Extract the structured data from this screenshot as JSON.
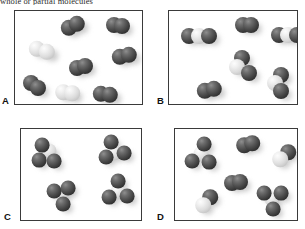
{
  "figure": {
    "caption_partial": "whole or partial molecules",
    "background_color": "#ffffff",
    "border_color": "#3a3a3a",
    "dark_atom_color": "#3a3a3a",
    "light_atom_color": "#dcdcdc"
  },
  "panels": [
    {
      "label": "A",
      "box": {
        "x": 14,
        "y": 10,
        "w": 129,
        "h": 95
      },
      "label_pos": {
        "x": 2,
        "y": 96
      },
      "description": "Six dark homonuclear diatomic molecules and two light homonuclear diatomic molecules",
      "molecules": [
        {
          "name": "dark-diatomic",
          "atoms": [
            {
              "type": "dark",
              "cx": 54,
              "cy": 17,
              "r": 8.2
            },
            {
              "type": "dark",
              "cx": 62,
              "cy": 13,
              "r": 8.2
            }
          ]
        },
        {
          "name": "dark-diatomic",
          "atoms": [
            {
              "type": "dark",
              "cx": 99,
              "cy": 14,
              "r": 8.0
            },
            {
              "type": "dark",
              "cx": 107,
              "cy": 15,
              "r": 8.0
            }
          ]
        },
        {
          "name": "light-diatomic",
          "atoms": [
            {
              "type": "light",
              "cx": 22,
              "cy": 38,
              "r": 8.2
            },
            {
              "type": "light",
              "cx": 32,
              "cy": 41,
              "r": 8.2
            }
          ]
        },
        {
          "name": "dark-diatomic",
          "atoms": [
            {
              "type": "dark",
              "cx": 105,
              "cy": 46,
              "r": 8.2
            },
            {
              "type": "dark",
              "cx": 114,
              "cy": 44,
              "r": 8.2
            }
          ]
        },
        {
          "name": "dark-diatomic",
          "atoms": [
            {
              "type": "dark",
              "cx": 62,
              "cy": 57,
              "r": 8.0
            },
            {
              "type": "dark",
              "cx": 70,
              "cy": 55,
              "r": 8.0
            }
          ]
        },
        {
          "name": "dark-diatomic",
          "atoms": [
            {
              "type": "dark",
              "cx": 16,
              "cy": 72,
              "r": 8.0
            },
            {
              "type": "dark",
              "cx": 23,
              "cy": 77,
              "r": 8.0
            }
          ]
        },
        {
          "name": "light-diatomic",
          "atoms": [
            {
              "type": "light",
              "cx": 48,
              "cy": 81,
              "r": 7.8
            },
            {
              "type": "light",
              "cx": 57,
              "cy": 82,
              "r": 7.8
            }
          ]
        },
        {
          "name": "dark-diatomic",
          "atoms": [
            {
              "type": "dark",
              "cx": 86,
              "cy": 83,
              "r": 8.2
            },
            {
              "type": "dark",
              "cx": 95,
              "cy": 84,
              "r": 8.2
            }
          ]
        }
      ]
    },
    {
      "label": "B",
      "box": {
        "x": 168,
        "y": 10,
        "w": 130,
        "h": 95
      },
      "label_pos": {
        "x": 157,
        "y": 96
      },
      "description": "Mixture of dark-light-dark triatomic molecules and dark homonuclear diatomic molecules",
      "molecules": [
        {
          "name": "dark-light-dark-triatomic",
          "atoms": [
            {
              "type": "dark",
              "cx": 20,
              "cy": 25,
              "r": 8.0
            },
            {
              "type": "light",
              "cx": 30,
              "cy": 25,
              "r": 8.0
            },
            {
              "type": "dark",
              "cx": 40,
              "cy": 25,
              "r": 8.0
            }
          ]
        },
        {
          "name": "dark-diatomic",
          "atoms": [
            {
              "type": "dark",
              "cx": 74,
              "cy": 14,
              "r": 8.0
            },
            {
              "type": "dark",
              "cx": 82,
              "cy": 14,
              "r": 8.0
            }
          ]
        },
        {
          "name": "dark-light-dark-triatomic",
          "atoms": [
            {
              "type": "dark",
              "cx": 110,
              "cy": 24,
              "r": 8.0
            },
            {
              "type": "light",
              "cx": 119,
              "cy": 24,
              "r": 8.0
            },
            {
              "type": "dark",
              "cx": 128,
              "cy": 24,
              "r": 8.0
            }
          ]
        },
        {
          "name": "dark-light-dark-triatomic",
          "atoms": [
            {
              "type": "dark",
              "cx": 73,
              "cy": 47,
              "r": 8.0
            },
            {
              "type": "light",
              "cx": 68,
              "cy": 56,
              "r": 8.0
            },
            {
              "type": "dark",
              "cx": 80,
              "cy": 62,
              "r": 8.0
            }
          ]
        },
        {
          "name": "dark-light-dark-triatomic",
          "atoms": [
            {
              "type": "dark",
              "cx": 112,
              "cy": 64,
              "r": 8.0
            },
            {
              "type": "light",
              "cx": 106,
              "cy": 72,
              "r": 8.0
            },
            {
              "type": "dark",
              "cx": 112,
              "cy": 80,
              "r": 8.0
            }
          ]
        },
        {
          "name": "dark-diatomic",
          "atoms": [
            {
              "type": "dark",
              "cx": 36,
              "cy": 80,
              "r": 8.2
            },
            {
              "type": "dark",
              "cx": 45,
              "cy": 78,
              "r": 8.2
            }
          ]
        }
      ]
    },
    {
      "label": "C",
      "box": {
        "x": 20,
        "y": 128,
        "w": 122,
        "h": 93
      },
      "label_pos": {
        "x": 4,
        "y": 212
      },
      "description": "Four identical triatomic cluster molecules, each one light atom bonded to three dark atoms",
      "molecules": [
        {
          "name": "light-core-trigonal-cluster",
          "atoms": [
            {
              "type": "light",
              "cx": 28,
              "cy": 22,
              "r": 7.6
            },
            {
              "type": "dark",
              "cx": 21,
              "cy": 16,
              "r": 7.4
            },
            {
              "type": "dark",
              "cx": 18,
              "cy": 31,
              "r": 7.4
            },
            {
              "type": "dark",
              "cx": 33,
              "cy": 32,
              "r": 7.4
            }
          ]
        },
        {
          "name": "light-core-trigonal-cluster",
          "atoms": [
            {
              "type": "light",
              "cx": 93,
              "cy": 24,
              "r": 7.6
            },
            {
              "type": "dark",
              "cx": 90,
              "cy": 13,
              "r": 7.4
            },
            {
              "type": "dark",
              "cx": 85,
              "cy": 28,
              "r": 7.4
            },
            {
              "type": "dark",
              "cx": 103,
              "cy": 24,
              "r": 7.4
            }
          ]
        },
        {
          "name": "light-core-trigonal-cluster",
          "atoms": [
            {
              "type": "light",
              "cx": 40,
              "cy": 64,
              "r": 7.6
            },
            {
              "type": "dark",
              "cx": 33,
              "cy": 62,
              "r": 7.4
            },
            {
              "type": "dark",
              "cx": 47,
              "cy": 59,
              "r": 7.4
            },
            {
              "type": "dark",
              "cx": 42,
              "cy": 75,
              "r": 7.4
            }
          ]
        },
        {
          "name": "light-core-trigonal-cluster",
          "atoms": [
            {
              "type": "light",
              "cx": 97,
              "cy": 63,
              "r": 7.6
            },
            {
              "type": "dark",
              "cx": 97,
              "cy": 52,
              "r": 7.4
            },
            {
              "type": "dark",
              "cx": 88,
              "cy": 68,
              "r": 7.4
            },
            {
              "type": "dark",
              "cx": 106,
              "cy": 67,
              "r": 7.4
            }
          ]
        }
      ]
    },
    {
      "label": "D",
      "box": {
        "x": 174,
        "y": 128,
        "w": 124,
        "h": 93
      },
      "label_pos": {
        "x": 157,
        "y": 212
      },
      "description": "Mixture of light-core trigonal clusters, dark diatomic molecules and dark-light diatomic molecules",
      "molecules": [
        {
          "name": "light-core-trigonal-cluster",
          "atoms": [
            {
              "type": "light",
              "cx": 26,
              "cy": 25,
              "r": 7.6
            },
            {
              "type": "dark",
              "cx": 29,
              "cy": 15,
              "r": 7.4
            },
            {
              "type": "dark",
              "cx": 17,
              "cy": 32,
              "r": 7.4
            },
            {
              "type": "dark",
              "cx": 34,
              "cy": 33,
              "r": 7.4
            }
          ]
        },
        {
          "name": "dark-diatomic",
          "atoms": [
            {
              "type": "dark",
              "cx": 69,
              "cy": 16,
              "r": 7.8
            },
            {
              "type": "dark",
              "cx": 77,
              "cy": 14,
              "r": 7.8
            }
          ]
        },
        {
          "name": "dark-light-diatomic",
          "atoms": [
            {
              "type": "dark",
              "cx": 113,
              "cy": 23,
              "r": 7.8
            },
            {
              "type": "light",
              "cx": 105,
              "cy": 30,
              "r": 7.8
            }
          ]
        },
        {
          "name": "dark-diatomic",
          "atoms": [
            {
              "type": "dark",
              "cx": 57,
              "cy": 54,
              "r": 8.0
            },
            {
              "type": "dark",
              "cx": 65,
              "cy": 53,
              "r": 8.0
            }
          ]
        },
        {
          "name": "dark-light-diatomic",
          "atoms": [
            {
              "type": "dark",
              "cx": 35,
              "cy": 68,
              "r": 7.8
            },
            {
              "type": "light",
              "cx": 28,
              "cy": 76,
              "r": 7.8
            }
          ]
        },
        {
          "name": "light-core-trigonal-cluster",
          "atoms": [
            {
              "type": "light",
              "cx": 97,
              "cy": 70,
              "r": 7.6
            },
            {
              "type": "dark",
              "cx": 89,
              "cy": 64,
              "r": 7.4
            },
            {
              "type": "dark",
              "cx": 106,
              "cy": 64,
              "r": 7.4
            },
            {
              "type": "dark",
              "cx": 98,
              "cy": 80,
              "r": 7.4
            }
          ]
        }
      ]
    }
  ]
}
